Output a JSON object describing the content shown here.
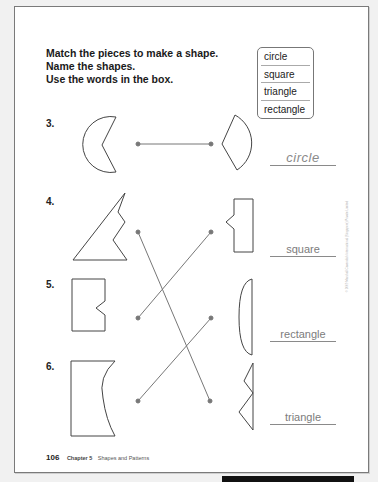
{
  "instructions": [
    "Match the pieces to make a shape.",
    "Name the shapes.",
    "Use the words in the box."
  ],
  "word_box": [
    "circle",
    "square",
    "triangle",
    "rectangle"
  ],
  "questions": [
    {
      "number": "3.",
      "answer": "circle"
    },
    {
      "number": "4.",
      "answer": "square"
    },
    {
      "number": "5.",
      "answer": "rectangle"
    },
    {
      "number": "6.",
      "answer": "triangle"
    }
  ],
  "copyright": "© 2009 Marshall Cavendish International (Singapore) Private Limited",
  "footer": {
    "page_number": "106",
    "chapter": "Chapter 5",
    "chapter_title": "Shapes and Patterns"
  }
}
